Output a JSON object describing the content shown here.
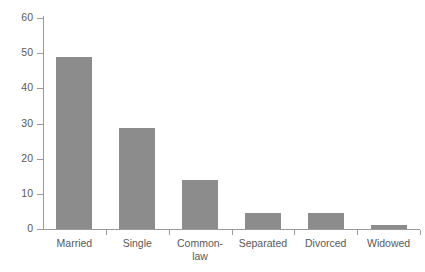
{
  "chart_data": {
    "type": "bar",
    "title": "",
    "subtitle": "",
    "xlabel": "",
    "ylabel": "",
    "categories": [
      "Married",
      "Single",
      "Common-\nlaw",
      "Separated",
      "Divorced",
      "Widowed"
    ],
    "values": [
      49,
      28.8,
      14,
      4.5,
      4.5,
      1
    ],
    "ylim": [
      0,
      60
    ],
    "yticks": [
      0,
      10,
      20,
      30,
      40,
      50,
      60
    ],
    "ytick_labels": [
      "0",
      "10",
      "20",
      "30",
      "40",
      "50",
      "60"
    ],
    "grid": false,
    "legend": false,
    "legend_position": "none",
    "bar_color": "#8c8c8c",
    "axis_color": "#9a9a9a",
    "text_color": "#595959",
    "background": "#ffffff"
  },
  "axis": {
    "y_labels": [
      "60",
      "50",
      "40",
      "30",
      "20",
      "10",
      "0"
    ],
    "y_values": [
      60,
      50,
      40,
      30,
      20,
      10,
      0
    ]
  },
  "bars": [
    {
      "label": "Married",
      "value": 49,
      "color": "#8c8c8c"
    },
    {
      "label": "Single",
      "value": 28.8,
      "color": "#8c8c8c"
    },
    {
      "label": "Common-\nlaw",
      "value": 14,
      "color": "#8c8c8c"
    },
    {
      "label": "Separated",
      "value": 4.5,
      "color": "#8c8c8c"
    },
    {
      "label": "Divorced",
      "value": 4.5,
      "color": "#8c8c8c"
    },
    {
      "label": "Widowed",
      "value": 1,
      "color": "#8c8c8c"
    }
  ]
}
